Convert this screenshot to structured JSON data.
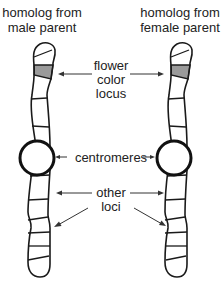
{
  "left_chromosome": {
    "title_lines": [
      "homolog from",
      "male parent"
    ]
  },
  "right_chromosome": {
    "title_lines": [
      "homolog from",
      "female parent"
    ]
  },
  "labels": {
    "flower_color_locus": [
      "flower",
      "color",
      "locus"
    ],
    "centromeres": "centromeres",
    "other_loci": [
      "other",
      "loci"
    ]
  },
  "colors": {
    "shaded_locus": "#9a9a9a",
    "outline": "#1a1a1a"
  }
}
